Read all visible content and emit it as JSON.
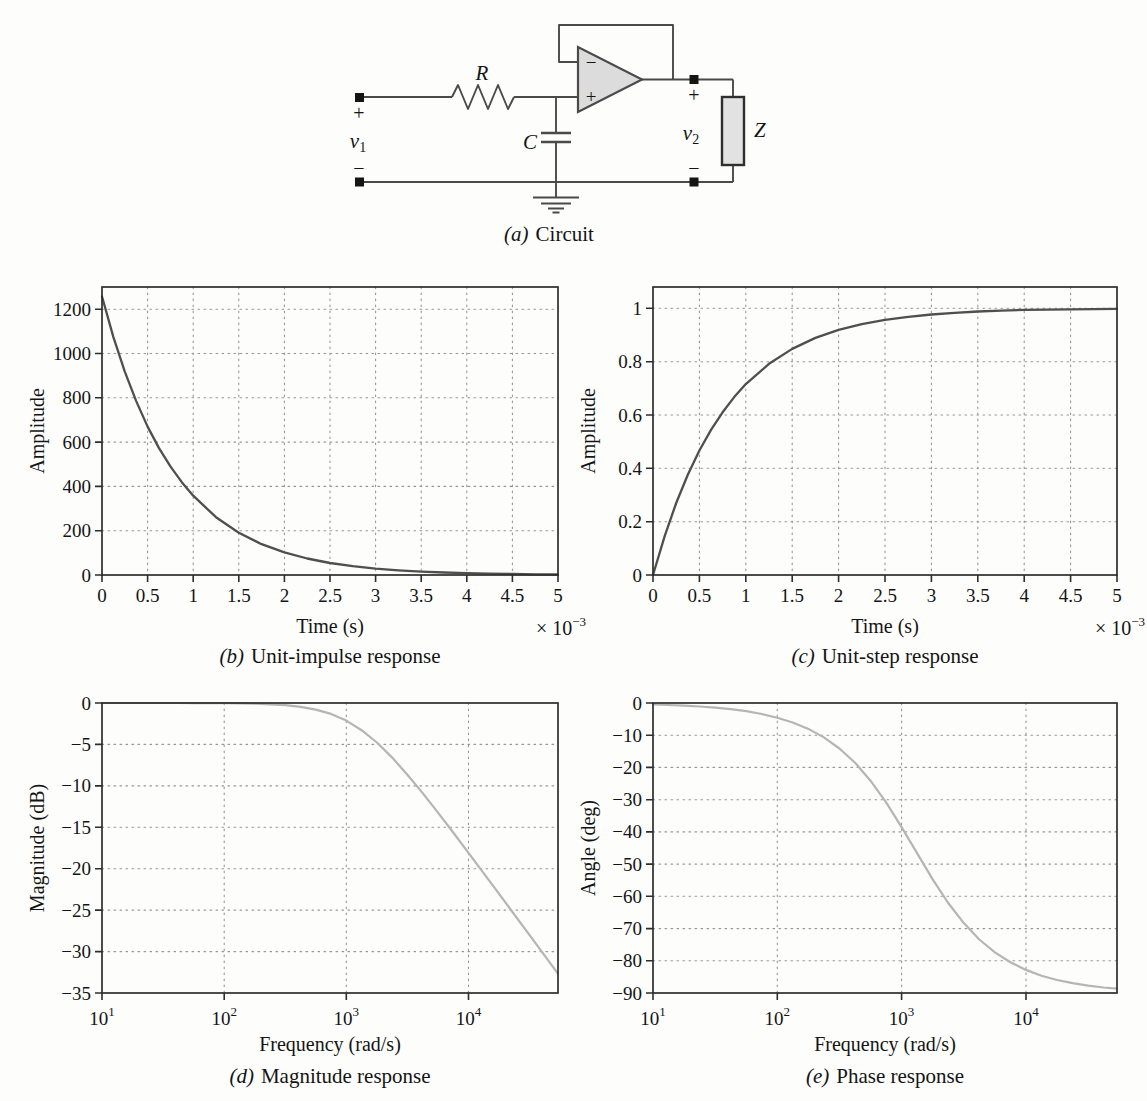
{
  "circuit": {
    "caption": {
      "label": "(a)",
      "text": "Circuit"
    },
    "labels": {
      "resistor": "R",
      "capacitor": "C",
      "impedance": "Z",
      "v1_base": "v",
      "v1_sub": "1",
      "v2_base": "v",
      "v2_sub": "2",
      "input_plus": "+",
      "input_minus": "−",
      "output_plus": "+",
      "output_minus": "−",
      "opamp_minus": "−",
      "opamp_plus": "+"
    },
    "colors": {
      "wire": "#4a4a4a",
      "opamp_fill": "#dcdcdc",
      "impedance_fill": "#e2e2e2",
      "terminal": "#151515"
    }
  },
  "chart_data": [
    {
      "id": "unit-impulse",
      "type": "line",
      "caption_label": "(b)",
      "caption_text": "Unit-impulse response",
      "xlabel": "Time (s)",
      "ylabel": "Amplitude",
      "x_offset": {
        "base": "× 10",
        "exp": "−3"
      },
      "xscale": "linear",
      "xlim": [
        0,
        5
      ],
      "ylim": [
        0,
        1300
      ],
      "grid": true,
      "xticks": [
        {
          "v": 0,
          "label": "0"
        },
        {
          "v": 0.5,
          "label": "0.5"
        },
        {
          "v": 1,
          "label": "1"
        },
        {
          "v": 1.5,
          "label": "1.5"
        },
        {
          "v": 2,
          "label": "2"
        },
        {
          "v": 2.5,
          "label": "2.5"
        },
        {
          "v": 3,
          "label": "3"
        },
        {
          "v": 3.5,
          "label": "3.5"
        },
        {
          "v": 4,
          "label": "4"
        },
        {
          "v": 4.5,
          "label": "4.5"
        },
        {
          "v": 5,
          "label": "5"
        }
      ],
      "yticks": [
        {
          "v": 0,
          "label": "0"
        },
        {
          "v": 200,
          "label": "200"
        },
        {
          "v": 400,
          "label": "400"
        },
        {
          "v": 600,
          "label": "600"
        },
        {
          "v": 800,
          "label": "800"
        },
        {
          "v": 1000,
          "label": "1000"
        },
        {
          "v": 1200,
          "label": "1200"
        }
      ],
      "x": [
        0,
        0.125,
        0.25,
        0.375,
        0.5,
        0.625,
        0.75,
        0.875,
        1,
        1.25,
        1.5,
        1.75,
        2,
        2.25,
        2.5,
        2.75,
        3,
        3.25,
        3.5,
        3.75,
        4,
        4.25,
        4.5,
        4.75,
        5
      ],
      "y": [
        1257,
        1074,
        918,
        785,
        670,
        573,
        490,
        419,
        358,
        261,
        191,
        139,
        102,
        74.3,
        54.3,
        39.6,
        28.9,
        21.1,
        15.4,
        11.3,
        8.2,
        6,
        4.4,
        3.2,
        2.3
      ],
      "line_color": "#4f4f4f",
      "line_width": 2.3
    },
    {
      "id": "unit-step",
      "type": "line",
      "caption_label": "(c)",
      "caption_text": "Unit-step response",
      "xlabel": "Time (s)",
      "ylabel": "Amplitude",
      "x_offset": {
        "base": "× 10",
        "exp": "−3"
      },
      "xscale": "linear",
      "xlim": [
        0,
        5
      ],
      "ylim": [
        0,
        1.08
      ],
      "grid": true,
      "xticks": [
        {
          "v": 0,
          "label": "0"
        },
        {
          "v": 0.5,
          "label": "0.5"
        },
        {
          "v": 1,
          "label": "1"
        },
        {
          "v": 1.5,
          "label": "1.5"
        },
        {
          "v": 2,
          "label": "2"
        },
        {
          "v": 2.5,
          "label": "2.5"
        },
        {
          "v": 3,
          "label": "3"
        },
        {
          "v": 3.5,
          "label": "3.5"
        },
        {
          "v": 4,
          "label": "4"
        },
        {
          "v": 4.5,
          "label": "4.5"
        },
        {
          "v": 5,
          "label": "5"
        }
      ],
      "yticks": [
        {
          "v": 0,
          "label": "0"
        },
        {
          "v": 0.2,
          "label": "0.2"
        },
        {
          "v": 0.4,
          "label": "0.4"
        },
        {
          "v": 0.6,
          "label": "0.6"
        },
        {
          "v": 0.8,
          "label": "0.8"
        },
        {
          "v": 1,
          "label": "1"
        }
      ],
      "x": [
        0,
        0.125,
        0.25,
        0.375,
        0.5,
        0.625,
        0.75,
        0.875,
        1,
        1.25,
        1.5,
        1.75,
        2,
        2.25,
        2.5,
        2.75,
        3,
        3.25,
        3.5,
        3.75,
        4,
        4.25,
        4.5,
        4.75,
        5
      ],
      "y": [
        0,
        0.145,
        0.27,
        0.376,
        0.467,
        0.544,
        0.61,
        0.667,
        0.716,
        0.792,
        0.848,
        0.889,
        0.919,
        0.941,
        0.957,
        0.968,
        0.977,
        0.983,
        0.988,
        0.991,
        0.994,
        0.995,
        0.996,
        0.997,
        0.998
      ],
      "line_color": "#4f4f4f",
      "line_width": 2.3
    },
    {
      "id": "magnitude",
      "type": "line",
      "caption_label": "(d)",
      "caption_text": "Magnitude response",
      "xlabel": "Frequency (rad/s)",
      "ylabel": "Magnitude (dB)",
      "xscale": "log",
      "xlim": [
        10,
        54000
      ],
      "ylim": [
        -35,
        0
      ],
      "grid": true,
      "xticks": [
        {
          "v": 10,
          "base": "10",
          "exp": "1"
        },
        {
          "v": 100,
          "base": "10",
          "exp": "2"
        },
        {
          "v": 1000,
          "base": "10",
          "exp": "3"
        },
        {
          "v": 10000,
          "base": "10",
          "exp": "4"
        }
      ],
      "yticks": [
        {
          "v": 0,
          "label": "0"
        },
        {
          "v": -5,
          "label": "−5"
        },
        {
          "v": -10,
          "label": "−10"
        },
        {
          "v": -15,
          "label": "−15"
        },
        {
          "v": -20,
          "label": "−20"
        },
        {
          "v": -25,
          "label": "−25"
        },
        {
          "v": -30,
          "label": "−30"
        },
        {
          "v": -35,
          "label": "−35"
        }
      ],
      "x": [
        10,
        13.3,
        17.8,
        23.7,
        31.6,
        42.2,
        56.2,
        75,
        100,
        133,
        178,
        237,
        316,
        422,
        562,
        750,
        1000,
        1334,
        1778,
        2371,
        3162,
        4217,
        5623,
        7499,
        10000,
        13335,
        17783,
        23714,
        31623,
        42170,
        53700
      ],
      "y": [
        0,
        0,
        0,
        0,
        -0.003,
        -0.005,
        -0.009,
        -0.015,
        -0.027,
        -0.049,
        -0.086,
        -0.152,
        -0.266,
        -0.463,
        -0.792,
        -1.32,
        -2.13,
        -3.28,
        -4.77,
        -6.59,
        -8.66,
        -10.88,
        -13.23,
        -15.63,
        -18.08,
        -20.55,
        -23.03,
        -25.53,
        -28.02,
        -30.52,
        -32.62
      ],
      "line_color": "#b5b5b5",
      "line_width": 2.2
    },
    {
      "id": "phase",
      "type": "line",
      "caption_label": "(e)",
      "caption_text": "Phase response",
      "xlabel": "Frequency (rad/s)",
      "ylabel": "Angle (deg)",
      "xscale": "log",
      "xlim": [
        10,
        54000
      ],
      "ylim": [
        -90,
        0
      ],
      "grid": true,
      "xticks": [
        {
          "v": 10,
          "base": "10",
          "exp": "1"
        },
        {
          "v": 100,
          "base": "10",
          "exp": "2"
        },
        {
          "v": 1000,
          "base": "10",
          "exp": "3"
        },
        {
          "v": 10000,
          "base": "10",
          "exp": "4"
        }
      ],
      "yticks": [
        {
          "v": 0,
          "label": "0"
        },
        {
          "v": -10,
          "label": "−10"
        },
        {
          "v": -20,
          "label": "−20"
        },
        {
          "v": -30,
          "label": "−30"
        },
        {
          "v": -40,
          "label": "−40"
        },
        {
          "v": -50,
          "label": "−50"
        },
        {
          "v": -60,
          "label": "−60"
        },
        {
          "v": -70,
          "label": "−70"
        },
        {
          "v": -80,
          "label": "−80"
        },
        {
          "v": -90,
          "label": "−90"
        }
      ],
      "x": [
        10,
        13.3,
        17.8,
        23.7,
        31.6,
        42.2,
        56.2,
        75,
        100,
        133,
        178,
        237,
        316,
        422,
        562,
        750,
        1000,
        1334,
        1778,
        2371,
        3162,
        4217,
        5623,
        7499,
        10000,
        13335,
        17783,
        23714,
        31623,
        42170,
        53700
      ],
      "y": [
        -0.46,
        -0.61,
        -0.81,
        -1.08,
        -1.44,
        -1.92,
        -2.56,
        -3.42,
        -4.55,
        -6.06,
        -8.05,
        -10.69,
        -14.12,
        -18.54,
        -24.1,
        -30.82,
        -38.5,
        -46.69,
        -54.74,
        -62.07,
        -68.32,
        -73.41,
        -77.4,
        -80.48,
        -82.84,
        -84.62,
        -85.96,
        -86.97,
        -87.72,
        -88.29,
        -88.66
      ],
      "line_color": "#b5b5b5",
      "line_width": 2.2
    }
  ]
}
